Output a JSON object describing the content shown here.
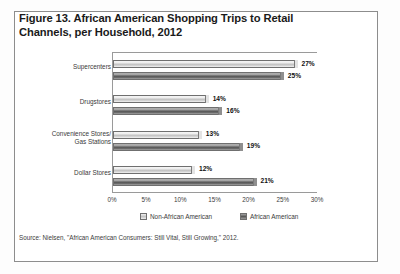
{
  "figure": {
    "title": "Figure 13. African American Shopping Trips to Retail Channels, per Household, 2012",
    "source_note": "Source: Nielsen, \"African American Consumers: Still Vital, Still Growing,\" 2012."
  },
  "chart_data": {
    "type": "bar",
    "orientation": "horizontal",
    "title": "Figure 13. African American Shopping Trips to Retail Channels, per Household, 2012",
    "categories": [
      "Supercenters",
      "Drugstores",
      "Convenience Stores/ Gas Stations",
      "Dollar Stores"
    ],
    "category_lines": [
      [
        "Supercenters"
      ],
      [
        "Drugstores"
      ],
      [
        "Convenience Stores/",
        "Gas Stations"
      ],
      [
        "Dollar Stores"
      ]
    ],
    "series": [
      {
        "name": "Non-African American",
        "values": [
          27,
          14,
          13,
          12
        ],
        "labels": [
          "27%",
          "14%",
          "13%",
          "12%"
        ],
        "color": "#d3d3d3"
      },
      {
        "name": "African American",
        "values": [
          25,
          16,
          19,
          21
        ],
        "labels": [
          "25%",
          "16%",
          "19%",
          "21%"
        ],
        "color": "#6e6e6e"
      }
    ],
    "xlabel": "",
    "ylabel": "",
    "xlim": [
      0,
      30
    ],
    "xticks": [
      0,
      5,
      10,
      15,
      20,
      25,
      30
    ],
    "xtick_labels": [
      "0%",
      "5%",
      "10%",
      "15%",
      "20%",
      "25%",
      "30%"
    ],
    "grid": false,
    "legend_position": "bottom",
    "value_labels": true,
    "units": "percent"
  }
}
